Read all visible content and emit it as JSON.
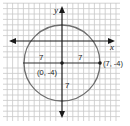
{
  "diagram": {
    "type": "coordinate-plane-circle",
    "axes": {
      "x_label": "x",
      "y_label": "y"
    },
    "circle": {
      "center": [
        0,
        -4
      ],
      "radius": 7
    },
    "points": [
      {
        "label": "(0, -4)",
        "x": 0,
        "y": -4
      },
      {
        "label": "(7, -4)",
        "x": 7,
        "y": -4
      }
    ],
    "segment_labels": {
      "left_radius": "7",
      "right_radius": "7",
      "down_radius": "7"
    },
    "colors": {
      "grid": "#c8c8c8",
      "axis": "#1a1a1a",
      "circle": "#6e6e6e",
      "radius": "#2a2a2a"
    }
  }
}
